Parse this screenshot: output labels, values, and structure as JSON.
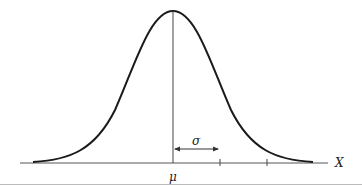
{
  "diagram": {
    "type": "normal-distribution-curve",
    "labels": {
      "mean": "μ",
      "sigma": "σ",
      "x_axis": "X"
    },
    "colors": {
      "curve": "#1a1a1a",
      "axis": "#555555",
      "bottom_rule": "#bbbbbb"
    },
    "ticks": [
      "μ",
      "μ+σ",
      "μ+2σ"
    ]
  }
}
